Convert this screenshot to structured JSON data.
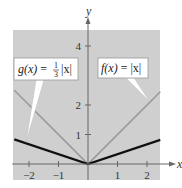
{
  "chart_data": {
    "type": "line",
    "title": "",
    "xlabel": "x",
    "ylabel": "y",
    "xlim": [
      -2.5,
      2.45
    ],
    "ylim": [
      -0.5,
      4.5
    ],
    "grid": false,
    "x_ticks": [
      -2,
      -1,
      1,
      2
    ],
    "x_tick_labels": [
      "−2",
      "−1",
      "1",
      "2"
    ],
    "y_ticks": [
      1,
      2,
      4
    ],
    "y_tick_labels": [
      "1",
      "2",
      "4"
    ],
    "series": [
      {
        "name": "f(x) = |x|",
        "label_text": {
          "lhs": "f(x)",
          "eq": " = ",
          "rhs": "|x|"
        },
        "x": [
          -2.5,
          0,
          2.45
        ],
        "y": [
          2.5,
          0,
          2.45
        ],
        "color": "#9a9a9a",
        "label_points_to_x": 2.1
      },
      {
        "name": "g(x) = (1/3)|x|",
        "label_text": {
          "lhs": "g(x)",
          "eq": " = ",
          "num": "1",
          "den": "3",
          "rhs": "|x|"
        },
        "x": [
          -2.5,
          0,
          2.45
        ],
        "y": [
          0.8333,
          0,
          0.8167
        ],
        "color": "#111111",
        "label_points_to_x": -2.1
      }
    ],
    "background_color": "#cfcfcf"
  }
}
